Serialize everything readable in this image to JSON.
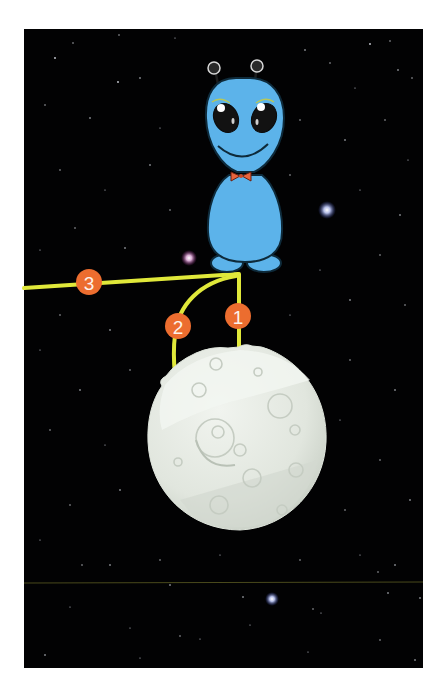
{
  "scene": {
    "description": "Blue alien standing above a cratered moon in starry space with three numbered paths",
    "colors": {
      "space": "#020203",
      "alien_body": "#5cb3ea",
      "alien_outline": "#0e2a3a",
      "bowtie": "#e8643c",
      "path_line": "#e0e83a",
      "badge": "#ec6d2f",
      "moon": "#e4e9e2",
      "moon_shadow": "#c9d0c6",
      "divider_line": "#4a4a1c"
    },
    "paths": [
      {
        "id": 1,
        "label": "1",
        "badge_x": 238,
        "badge_y": 317
      },
      {
        "id": 2,
        "label": "2",
        "badge_x": 178,
        "badge_y": 326
      },
      {
        "id": 3,
        "label": "3",
        "badge_x": 89,
        "badge_y": 282
      }
    ],
    "bright_stars": [
      {
        "x": 327,
        "y": 210,
        "color": "#dfe6ff"
      },
      {
        "x": 189,
        "y": 258,
        "color": "#f6d6f2"
      },
      {
        "x": 272,
        "y": 599,
        "color": "#e2e8ff"
      }
    ]
  }
}
